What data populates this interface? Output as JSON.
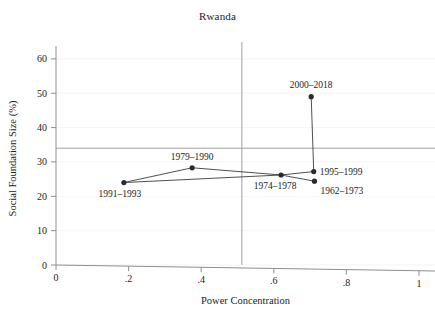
{
  "chart_data": {
    "type": "scatter",
    "title": "Rwanda",
    "xlabel": "Power Concentration",
    "ylabel": "Social Foundation Size (%)",
    "xlim": [
      0,
      1
    ],
    "ylim": [
      0,
      62
    ],
    "grid": true,
    "legend": "none",
    "xticks": [
      {
        "value": 0,
        "label": "0"
      },
      {
        "value": 0.2,
        "label": ".2"
      },
      {
        "value": 0.4,
        "label": ".4"
      },
      {
        "value": 0.6,
        "label": ".6"
      },
      {
        "value": 0.8,
        "label": ".8"
      },
      {
        "value": 1.0,
        "label": "1"
      }
    ],
    "yticks": [
      {
        "value": 0,
        "label": "0"
      },
      {
        "value": 10,
        "label": "10"
      },
      {
        "value": 20,
        "label": "20"
      },
      {
        "value": 30,
        "label": "30"
      },
      {
        "value": 40,
        "label": "40"
      },
      {
        "value": 50,
        "label": "50"
      },
      {
        "value": 60,
        "label": "60"
      }
    ],
    "reference_lines": [
      {
        "orientation": "horizontal",
        "value": 34.0
      },
      {
        "orientation": "vertical",
        "value": 0.512
      }
    ],
    "points": [
      {
        "label": "1991–1993",
        "x": 0.187,
        "y": 24.0,
        "label_dx": -4,
        "label_dy": 14,
        "label_anchor": "middle"
      },
      {
        "label": "1979–1990",
        "x": 0.375,
        "y": 28.3,
        "label_dx": 0,
        "label_dy": -8,
        "label_anchor": "middle"
      },
      {
        "label": "1974–1978",
        "x": 0.62,
        "y": 26.2,
        "label_dx": -6,
        "label_dy": 14,
        "label_anchor": "middle"
      },
      {
        "label": "1962–1973",
        "x": 0.712,
        "y": 24.4,
        "label_dx": 6,
        "label_dy": 13,
        "label_anchor": "start"
      },
      {
        "label": "1995–1999",
        "x": 0.71,
        "y": 27.2,
        "label_dx": 6,
        "label_dy": 3.5,
        "label_anchor": "start"
      },
      {
        "label": "2000–2018",
        "x": 0.703,
        "y": 49.0,
        "label_dx": 0,
        "label_dy": -9,
        "label_anchor": "middle"
      }
    ],
    "path_order": [
      "1991–1993",
      "1979–1990",
      "1974–1978",
      "1962–1973"
    ],
    "path_order_2": [
      "1991–1993",
      "1974–1978",
      "1995–1999",
      "2000–2018"
    ],
    "colors": {
      "marker": "#2a2a2e",
      "line": "#3c3c40",
      "axis": "#8e8e93",
      "grid": "#efeff1",
      "reference": "#a0a0a5",
      "text": "#1c1c1c"
    }
  }
}
